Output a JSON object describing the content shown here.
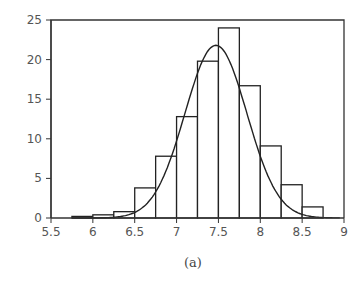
{
  "caption": "(a)",
  "chart_data": {
    "type": "bar",
    "subtype": "histogram_with_normal_fit",
    "title": "",
    "xlabel": "",
    "ylabel": "",
    "xlim": [
      5.5,
      9
    ],
    "ylim": [
      0,
      25
    ],
    "grid": false,
    "legend": null,
    "x_ticks": [
      "5.5",
      "6",
      "6.5",
      "7",
      "7.5",
      "8",
      "8.5",
      "9"
    ],
    "y_ticks": [
      "0",
      "5",
      "10",
      "15",
      "20",
      "25"
    ],
    "bin_width": 0.25,
    "bins": [
      {
        "left": 5.75,
        "right": 6.0,
        "value": 0.2
      },
      {
        "left": 6.0,
        "right": 6.25,
        "value": 0.4
      },
      {
        "left": 6.25,
        "right": 6.5,
        "value": 0.8
      },
      {
        "left": 6.5,
        "right": 6.75,
        "value": 3.8
      },
      {
        "left": 6.75,
        "right": 7.0,
        "value": 7.8
      },
      {
        "left": 7.0,
        "right": 7.25,
        "value": 12.8
      },
      {
        "left": 7.25,
        "right": 7.5,
        "value": 19.8
      },
      {
        "left": 7.5,
        "right": 7.75,
        "value": 24.0
      },
      {
        "left": 7.75,
        "right": 8.0,
        "value": 16.7
      },
      {
        "left": 8.0,
        "right": 8.25,
        "value": 9.1
      },
      {
        "left": 8.25,
        "right": 8.5,
        "value": 4.2
      },
      {
        "left": 8.5,
        "right": 8.75,
        "value": 1.4
      }
    ],
    "series": [
      {
        "name": "histogram",
        "type": "bar"
      },
      {
        "name": "normal fit",
        "type": "line",
        "mean": 7.47,
        "peak": 21.8,
        "sigma": 0.37
      }
    ]
  }
}
